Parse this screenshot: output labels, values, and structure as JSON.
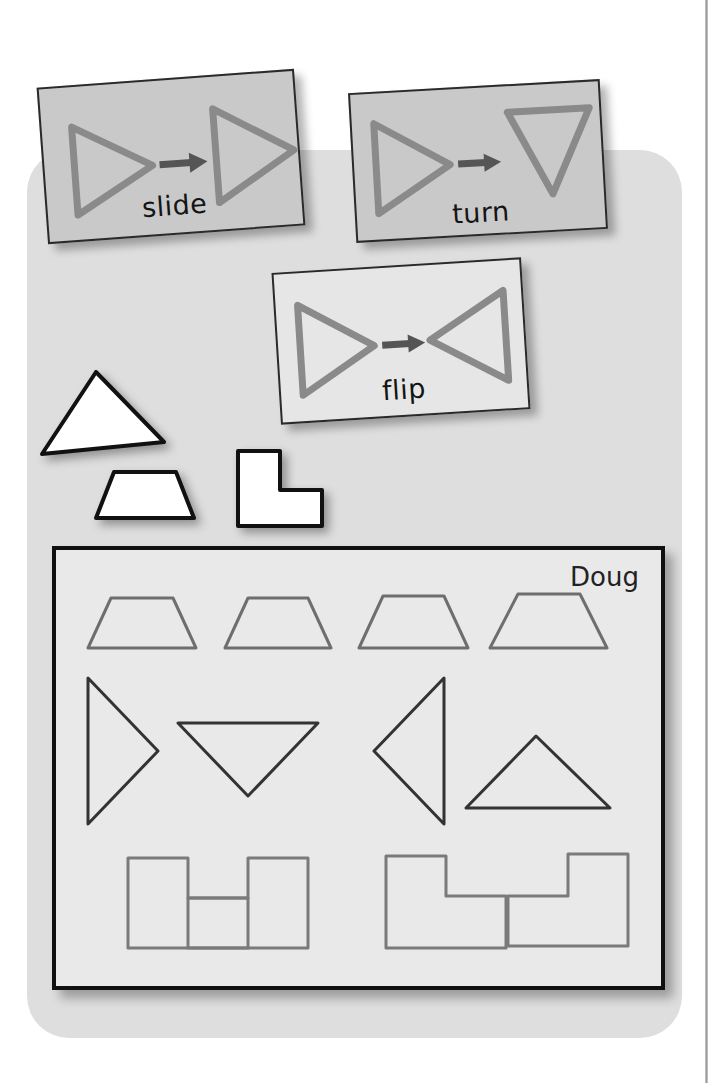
{
  "scene": {
    "title": "Slide, Turn, Flip transformation cards with student worksheet",
    "background_color": "#ffffff",
    "backdrop_color": "#dedede"
  },
  "cards": [
    {
      "id": "slide",
      "label": "slide",
      "card_color": "#c9c9c9",
      "shape_color": "#8a8a8a",
      "before_shape": "triangle-pointing-right",
      "after_shape": "triangle-pointing-right",
      "arrow": "right-arrow"
    },
    {
      "id": "turn",
      "label": "turn",
      "card_color": "#c9c9c9",
      "shape_color": "#8a8a8a",
      "before_shape": "triangle-pointing-right",
      "after_shape": "triangle-pointing-down",
      "arrow": "right-arrow"
    },
    {
      "id": "flip",
      "label": "flip",
      "card_color": "#e6e6e6",
      "shape_color": "#8a8a8a",
      "before_shape": "triangle-pointing-right",
      "after_shape": "triangle-pointing-left",
      "arrow": "right-arrow"
    }
  ],
  "loose_shapes": [
    {
      "id": "triangle",
      "name": "white-triangle",
      "fill": "#ffffff",
      "stroke": "#111111"
    },
    {
      "id": "trapezoid",
      "name": "white-trapezoid",
      "fill": "#ffffff",
      "stroke": "#111111"
    },
    {
      "id": "lshape",
      "name": "white-l-shape",
      "fill": "#ffffff",
      "stroke": "#111111"
    }
  ],
  "worksheet": {
    "student_name": "Doug",
    "paper_color": "#e9e9e9",
    "border_color": "#101010",
    "outline_color": "#6e6e6e",
    "rows": [
      {
        "id": "trapezoid-row",
        "shape": "trapezoid",
        "count": 4,
        "orientations": [
          "upright",
          "upright",
          "upright",
          "upright"
        ]
      },
      {
        "id": "triangle-row",
        "shape": "triangle",
        "count": 4,
        "orientations": [
          "pointing-right",
          "pointing-down",
          "pointing-left",
          "pointing-up"
        ]
      },
      {
        "id": "lshape-row",
        "shape": "l-shape",
        "count": 4,
        "orientations": [
          "notch-top-right",
          "notch-top-left",
          "notch-top-right",
          "notch-top-left"
        ]
      }
    ]
  }
}
